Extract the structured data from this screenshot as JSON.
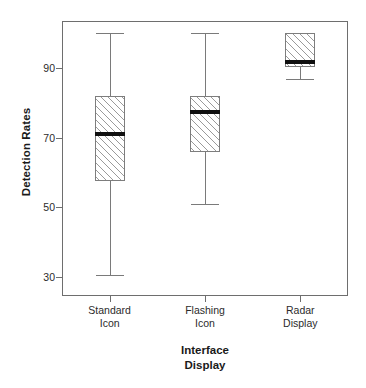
{
  "chart_data": {
    "type": "box",
    "title": "",
    "xlabel": "Interface Display",
    "xlabel_lines": [
      "Interface",
      "Display"
    ],
    "ylabel": "Detection Rates",
    "categories": [
      "Standard Icon",
      "Flashing Icon",
      "Radar Display"
    ],
    "category_lines": [
      [
        "Standard",
        "Icon"
      ],
      [
        "Flashing",
        "Icon"
      ],
      [
        "Radar",
        "Display"
      ]
    ],
    "y_ticks": [
      30,
      50,
      70,
      90
    ],
    "y_tick_labels": [
      "30",
      "50",
      "70",
      "90"
    ],
    "ylim": [
      26,
      104
    ],
    "grid": false,
    "legend": false,
    "boxes": [
      {
        "category": "Standard Icon",
        "whisker_low": 30.5,
        "q1": 57.5,
        "median": 71.0,
        "q3": 82.0,
        "whisker_high": 100.0
      },
      {
        "category": "Flashing Icon",
        "whisker_low": 51.0,
        "q1": 66.0,
        "median": 77.5,
        "q3": 82.0,
        "whisker_high": 100.0
      },
      {
        "category": "Radar Display",
        "whisker_low": 86.8,
        "q1": 90.3,
        "median": 91.8,
        "q3": 100.0,
        "whisker_high": 100.0
      }
    ],
    "colors": {
      "box_fill": "#ffffff",
      "box_hatch": "#9a9a9a",
      "box_edge": "#7d7d7d",
      "median": "#101010",
      "whisker": "#7a7a7a",
      "frame": "#6e6e6e",
      "text": "#1a1a1a",
      "background": "#ffffff"
    }
  }
}
